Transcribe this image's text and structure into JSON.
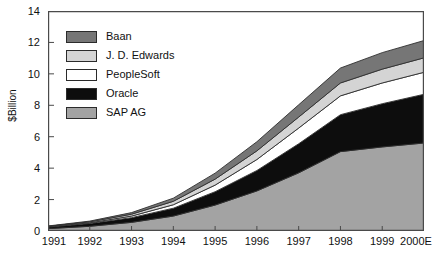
{
  "chart_data": {
    "type": "area",
    "stacked": true,
    "title": "",
    "xlabel": "",
    "ylabel": "$Billion",
    "categories": [
      "1991",
      "1992",
      "1993",
      "1994",
      "1995",
      "1996",
      "1997",
      "1998",
      "1999",
      "2000E"
    ],
    "ylim": [
      0,
      14
    ],
    "yticks": [
      0,
      2,
      4,
      6,
      8,
      10,
      12,
      14
    ],
    "grid": false,
    "legend_position": "upper-left-inside",
    "series": [
      {
        "name": "SAP AG",
        "color": "#a3a3a3",
        "values": [
          0.15,
          0.3,
          0.55,
          0.95,
          1.65,
          2.55,
          3.7,
          5.05,
          5.35,
          5.6
        ]
      },
      {
        "name": "Oracle",
        "color": "#0d0d0d",
        "values": [
          0.1,
          0.18,
          0.3,
          0.5,
          0.85,
          1.3,
          1.85,
          2.35,
          2.75,
          3.1
        ]
      },
      {
        "name": "PeopleSoft",
        "color": "#ffffff",
        "values": [
          0.02,
          0.04,
          0.1,
          0.22,
          0.42,
          0.7,
          1.0,
          1.2,
          1.32,
          1.4
        ]
      },
      {
        "name": "J. D. Edwards",
        "color": "#d4d4d4",
        "values": [
          0.03,
          0.06,
          0.12,
          0.22,
          0.38,
          0.55,
          0.7,
          0.82,
          0.88,
          0.92
        ]
      },
      {
        "name": "Baan",
        "color": "#767676",
        "values": [
          0.02,
          0.05,
          0.1,
          0.2,
          0.38,
          0.58,
          0.78,
          0.95,
          1.05,
          1.1
        ]
      }
    ]
  },
  "legend": {
    "items": [
      {
        "label": "Baan",
        "color": "#767676"
      },
      {
        "label": "J. D. Edwards",
        "color": "#d4d4d4"
      },
      {
        "label": "PeopleSoft",
        "color": "#ffffff"
      },
      {
        "label": "Oracle",
        "color": "#0d0d0d"
      },
      {
        "label": "SAP AG",
        "color": "#a3a3a3"
      }
    ]
  },
  "axes": {
    "y_label": "$Billion",
    "y_ticks": [
      "0",
      "2",
      "4",
      "6",
      "8",
      "10",
      "12",
      "14"
    ],
    "x_ticks": [
      "1991",
      "1992",
      "1993",
      "1994",
      "1995",
      "1996",
      "1997",
      "1998",
      "1999",
      "2000E"
    ]
  },
  "style": {
    "frame_color": "#4a4a4a",
    "text_color": "#111111"
  }
}
